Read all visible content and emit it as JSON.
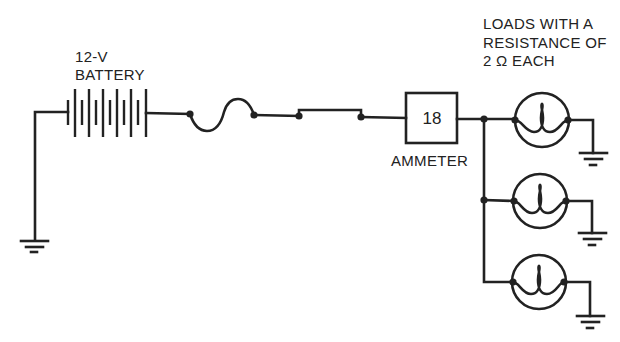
{
  "diagram": {
    "type": "circuit-schematic",
    "stroke_color": "#222222",
    "background": "#ffffff",
    "battery": {
      "label_line1": "12-V",
      "label_line2": "BATTERY",
      "cells": 6
    },
    "fuse": {
      "icon": "fuse-symbol"
    },
    "switch": {
      "icon": "closed-switch-symbol",
      "state": "closed"
    },
    "ammeter": {
      "reading": "18",
      "label": "AMMETER"
    },
    "loads": {
      "label_line1": "LOADS WITH A",
      "label_line2": "RESISTANCE OF",
      "label_line3": "2 Ω EACH",
      "count": 3,
      "icon": "lamp-symbol"
    },
    "grounds": {
      "count": 4,
      "icon": "ground-symbol"
    }
  }
}
